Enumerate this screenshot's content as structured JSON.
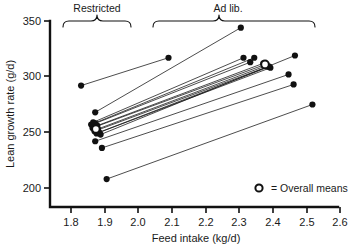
{
  "chart_data": {
    "type": "scatter",
    "title": "",
    "xlabel": "Feed intake (kg/d)",
    "ylabel": "Lean growth rate (g/d)",
    "xlim": [
      1.75,
      2.6
    ],
    "ylim": [
      190,
      352
    ],
    "xticks": [
      "1.8",
      "1.9",
      "2.0",
      "2.1",
      "2.2",
      "2.3",
      "2.4",
      "2.5",
      "2.6"
    ],
    "xtick_values": [
      1.8,
      1.9,
      2.0,
      2.1,
      2.2,
      2.3,
      2.4,
      2.5,
      2.6
    ],
    "yticks": [
      "200",
      "250",
      "300",
      "350"
    ],
    "ytick_values": [
      200,
      250,
      300,
      350
    ],
    "grid": false,
    "legend_position": "inside-bottom-right",
    "groups": [
      {
        "name": "Restricted",
        "label": "Restricted",
        "x_range": [
          1.77,
          1.95
        ]
      },
      {
        "name": "Ad lib.",
        "label": "Ad lib.",
        "x_range": [
          2.06,
          2.55
        ]
      }
    ],
    "series": [
      {
        "name": "paired observations",
        "marker": "filled-circle",
        "pairs": [
          {
            "restricted": {
              "x": 1.83,
              "y": 292
            },
            "adlib": {
              "x": 2.09,
              "y": 317
            }
          },
          {
            "restricted": {
              "x": 1.872,
              "y": 268
            },
            "adlib": {
              "x": 2.305,
              "y": 344
            }
          },
          {
            "restricted": {
              "x": 1.866,
              "y": 259
            },
            "adlib": {
              "x": 2.313,
              "y": 317
            }
          },
          {
            "restricted": {
              "x": 1.872,
              "y": 258
            },
            "adlib": {
              "x": 2.333,
              "y": 313
            }
          },
          {
            "restricted": {
              "x": 1.86,
              "y": 257
            },
            "adlib": {
              "x": 2.345,
              "y": 317
            }
          },
          {
            "restricted": {
              "x": 1.878,
              "y": 256
            },
            "adlib": {
              "x": 2.372,
              "y": 312
            }
          },
          {
            "restricted": {
              "x": 1.864,
              "y": 254
            },
            "adlib": {
              "x": 2.378,
              "y": 311
            }
          },
          {
            "restricted": {
              "x": 1.88,
              "y": 253
            },
            "adlib": {
              "x": 2.382,
              "y": 310
            }
          },
          {
            "restricted": {
              "x": 1.87,
              "y": 251
            },
            "adlib": {
              "x": 2.386,
              "y": 309
            }
          },
          {
            "restricted": {
              "x": 1.884,
              "y": 250
            },
            "adlib": {
              "x": 2.39,
              "y": 309
            }
          },
          {
            "restricted": {
              "x": 1.876,
              "y": 249
            },
            "adlib": {
              "x": 2.393,
              "y": 308
            }
          },
          {
            "restricted": {
              "x": 1.888,
              "y": 248
            },
            "adlib": {
              "x": 2.466,
              "y": 319
            }
          },
          {
            "restricted": {
              "x": 1.872,
              "y": 242
            },
            "adlib": {
              "x": 2.447,
              "y": 302
            }
          },
          {
            "restricted": {
              "x": 1.892,
              "y": 236
            },
            "adlib": {
              "x": 2.462,
              "y": 293
            }
          },
          {
            "restricted": {
              "x": 1.906,
              "y": 208
            },
            "adlib": {
              "x": 2.518,
              "y": 275
            }
          }
        ]
      },
      {
        "name": "Overall means",
        "marker": "open-circle",
        "points": [
          {
            "x": 1.874,
            "y": 253
          },
          {
            "x": 2.377,
            "y": 311
          }
        ]
      }
    ],
    "legend": [
      {
        "marker": "open-circle",
        "text": "=  Overall means"
      }
    ]
  }
}
